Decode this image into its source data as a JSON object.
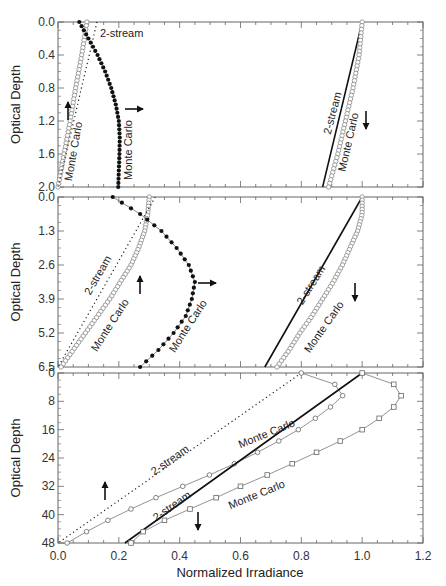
{
  "chart_data": {
    "type": "line",
    "layout": "three vertically stacked panels sharing x-axis",
    "xlabel": "Normalized Irradiance",
    "x_ticks": [
      "0.0",
      "0.2",
      "0.4",
      "0.6",
      "0.8",
      "1.0",
      "1.2"
    ],
    "xlim": [
      0.0,
      1.2
    ],
    "grid": false,
    "legend": "none (inline curve annotations)",
    "panels": [
      {
        "ylabel": "Optical Depth",
        "y_ticks": [
          "0.0",
          "0.4",
          "0.8",
          "1.2",
          "1.6",
          "2.0"
        ],
        "ylim": [
          0.0,
          2.0
        ],
        "y_inverted": true,
        "series": [
          {
            "name": "Monte Carlo (upward, open circles)",
            "style": "open-circle",
            "y": [
              0.0,
              0.4,
              0.8,
              1.2,
              1.6,
              2.0
            ],
            "x": [
              0.095,
              0.078,
              0.058,
              0.04,
              0.02,
              0.0
            ]
          },
          {
            "name": "2-stream (upward, dotted)",
            "style": "dotted",
            "y": [
              0.0,
              0.4,
              0.8,
              1.2,
              1.6,
              2.0
            ],
            "x": [
              0.128,
              0.103,
              0.077,
              0.052,
              0.026,
              0.0
            ]
          },
          {
            "name": "Monte Carlo (horizontal, solid dots)",
            "style": "filled-circle",
            "y": [
              0.0,
              0.2,
              0.4,
              0.6,
              0.8,
              1.0,
              1.2,
              1.4,
              1.6,
              1.8,
              2.0
            ],
            "x": [
              0.07,
              0.1,
              0.13,
              0.155,
              0.175,
              0.19,
              0.2,
              0.203,
              0.202,
              0.2,
              0.198
            ]
          },
          {
            "name": "2-stream (downward, solid)",
            "style": "solid",
            "y": [
              0.0,
              2.0
            ],
            "x": [
              1.0,
              0.87
            ]
          },
          {
            "name": "Monte Carlo (downward, open circles)",
            "style": "open-circle",
            "y": [
              0.0,
              0.4,
              0.8,
              1.2,
              1.6,
              2.0
            ],
            "x": [
              1.0,
              0.99,
              0.97,
              0.945,
              0.92,
              0.89
            ]
          }
        ],
        "annotations": [
          {
            "text": "2-stream",
            "target": "dotted upward"
          },
          {
            "text": "Monte Carlo",
            "target": "open circles upward"
          },
          {
            "text": "Monte Carlo",
            "target": "solid dots"
          },
          {
            "text": "2-stream",
            "target": "solid downward"
          },
          {
            "text": "Monte Carlo",
            "target": "open circles downward"
          },
          {
            "arrow": "up"
          },
          {
            "arrow": "right"
          },
          {
            "arrow": "down"
          }
        ]
      },
      {
        "ylabel": "Optical Depth",
        "y_ticks": [
          "0.0",
          "1.3",
          "2.6",
          "3.9",
          "5.2",
          "6.5"
        ],
        "ylim": [
          0.0,
          6.5
        ],
        "y_inverted": true,
        "series": [
          {
            "name": "Monte Carlo (upward, open circles)",
            "style": "open-circle",
            "y": [
              0.0,
              0.65,
              1.3,
              1.95,
              2.6,
              3.25,
              3.9,
              4.55,
              5.2,
              5.85,
              6.5
            ],
            "x": [
              0.3,
              0.295,
              0.285,
              0.265,
              0.24,
              0.205,
              0.17,
              0.13,
              0.09,
              0.05,
              0.01
            ]
          },
          {
            "name": "2-stream (upward, dotted)",
            "style": "dotted",
            "y": [
              0.0,
              6.5
            ],
            "x": [
              0.32,
              0.0
            ]
          },
          {
            "name": "Monte Carlo (horizontal, solid dots)",
            "style": "filled-circle",
            "y": [
              0.0,
              0.65,
              1.3,
              1.95,
              2.6,
              3.25,
              3.9,
              4.55,
              5.2,
              5.85,
              6.5
            ],
            "x": [
              0.18,
              0.27,
              0.34,
              0.39,
              0.43,
              0.45,
              0.44,
              0.42,
              0.38,
              0.33,
              0.27
            ]
          },
          {
            "name": "2-stream (downward, solid)",
            "style": "solid",
            "y": [
              0.0,
              6.5
            ],
            "x": [
              1.0,
              0.68
            ]
          },
          {
            "name": "Monte Carlo (downward, open circles)",
            "style": "open-circle",
            "y": [
              0.0,
              0.65,
              1.3,
              1.95,
              2.6,
              3.25,
              3.9,
              4.55,
              5.2,
              5.85,
              6.5
            ],
            "x": [
              1.0,
              1.0,
              0.985,
              0.96,
              0.935,
              0.905,
              0.87,
              0.835,
              0.795,
              0.76,
              0.72
            ]
          }
        ],
        "annotations": [
          {
            "text": "2-stream",
            "target": "dotted upward"
          },
          {
            "text": "Monte Carlo",
            "target": "open circles upward"
          },
          {
            "text": "Monte Carlo",
            "target": "solid dots"
          },
          {
            "text": "2-stream",
            "target": "solid downward"
          },
          {
            "text": "Monte Carlo",
            "target": "open circles downward"
          },
          {
            "arrow": "up"
          },
          {
            "arrow": "right"
          },
          {
            "arrow": "down"
          }
        ]
      },
      {
        "ylabel": "Optical Depth",
        "y_ticks": [
          "0",
          "8",
          "16",
          "24",
          "32",
          "40",
          "48"
        ],
        "ylim": [
          0,
          48
        ],
        "y_inverted": true,
        "series": [
          {
            "name": "2-stream (upward, dotted)",
            "style": "dotted",
            "y": [
              0,
              48
            ],
            "x": [
              0.8,
              0.0
            ]
          },
          {
            "name": "Monte Carlo (upward, open circles)",
            "style": "open-circle-line",
            "y": [
              0,
              2,
              4,
              6,
              8,
              10,
              12,
              16,
              20,
              24,
              28,
              32,
              36,
              40,
              44,
              48
            ],
            "x": [
              0.8,
              0.88,
              0.93,
              0.94,
              0.92,
              0.89,
              0.86,
              0.79,
              0.71,
              0.62,
              0.52,
              0.41,
              0.3,
              0.2,
              0.11,
              0.03
            ]
          },
          {
            "name": "2-stream (downward, solid)",
            "style": "solid",
            "y": [
              0,
              48
            ],
            "x": [
              1.0,
              0.22
            ]
          },
          {
            "name": "Monte Carlo (downward, open squares)",
            "style": "open-square-line",
            "y": [
              0,
              2,
              4,
              6,
              8,
              10,
              12,
              16,
              20,
              24,
              28,
              32,
              36,
              40,
              44,
              48
            ],
            "x": [
              1.0,
              1.08,
              1.12,
              1.13,
              1.12,
              1.1,
              1.07,
              1.0,
              0.91,
              0.81,
              0.71,
              0.6,
              0.5,
              0.39,
              0.29,
              0.24
            ]
          }
        ],
        "annotations": [
          {
            "text": "2-stream",
            "target": "dotted upward"
          },
          {
            "text": "Monte Carlo",
            "target": "open circles upward"
          },
          {
            "text": "2-stream",
            "target": "solid downward"
          },
          {
            "text": "Monte Carlo",
            "target": "open squares downward"
          },
          {
            "arrow": "up"
          },
          {
            "arrow": "down"
          }
        ]
      }
    ]
  },
  "labels": {
    "ylabel": "Optical Depth",
    "xlabel": "Normalized Irradiance",
    "two_stream": "2-stream",
    "monte_carlo": "Monte Carlo"
  }
}
